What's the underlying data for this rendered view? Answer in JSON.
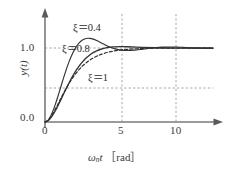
{
  "figure": {
    "name": "step-response-second-order-system",
    "background_color": "#ffffff",
    "axis_color": "#6e6e6e",
    "curve_color": "#333333",
    "grid_color": "#9a9a9a"
  },
  "axes": {
    "y_axis_label": "y(t)",
    "x_axis_label_symbol": "ω",
    "x_axis_label_subscript": "n",
    "x_axis_label_var": "t",
    "x_axis_label_unit": "［rad］",
    "x_axis_label_full": "ωnt ［rad］",
    "x_ticks": [
      "0",
      "5",
      "10"
    ],
    "y_ticks": [
      "0.0",
      "1.0"
    ]
  },
  "curve_labels": [
    {
      "name": "zeta-0-4",
      "text": "ξ＝0.4"
    },
    {
      "name": "zeta-0-8",
      "text": "ξ＝0.8"
    },
    {
      "name": "zeta-1",
      "text": "ξ＝1"
    }
  ],
  "chart_data": {
    "type": "line",
    "title": "",
    "xlabel": "ωnt ［rad］",
    "ylabel": "y(t)",
    "xlim": [
      0,
      12.2
    ],
    "ylim": [
      0,
      1.42
    ],
    "x_ticks": [
      0,
      5,
      10
    ],
    "x_tick_labels": [
      "0",
      "5",
      "10"
    ],
    "y_ticks": [
      0.0,
      1.0
    ],
    "y_tick_labels": [
      "0.0",
      "1.0"
    ],
    "grid": true,
    "gridlines_horizontal": [
      0.5,
      1.0
    ],
    "gridlines_vertical": [
      5,
      10
    ],
    "legend": "inline-annotations",
    "series": [
      {
        "name": "ξ＝0.4",
        "zeta": 0.4,
        "style": "solid",
        "color": "#333333",
        "x": [
          0,
          0.25,
          0.5,
          0.75,
          1,
          1.25,
          1.5,
          1.75,
          2,
          2.25,
          2.5,
          2.75,
          3,
          3.25,
          3.5,
          3.75,
          4,
          4.25,
          4.5,
          4.75,
          5,
          5.5,
          6,
          6.5,
          7,
          7.5,
          8,
          8.5,
          9,
          9.5,
          10,
          10.5,
          11,
          11.5,
          12,
          12.2
        ],
        "y": [
          0,
          0.03,
          0.115,
          0.238,
          0.384,
          0.537,
          0.684,
          0.816,
          0.926,
          1.012,
          1.073,
          1.111,
          1.129,
          1.131,
          1.12,
          1.101,
          1.078,
          1.053,
          1.03,
          1.009,
          0.993,
          0.972,
          0.966,
          0.971,
          0.982,
          0.994,
          1.004,
          1.011,
          1.014,
          1.013,
          1.009,
          1.004,
          0.999,
          0.996,
          0.994,
          0.994
        ]
      },
      {
        "name": "ξ＝0.8",
        "zeta": 0.8,
        "style": "solid",
        "color": "#333333",
        "x": [
          0,
          0.25,
          0.5,
          0.75,
          1,
          1.25,
          1.5,
          1.75,
          2,
          2.25,
          2.5,
          2.75,
          3,
          3.25,
          3.5,
          3.75,
          4,
          4.5,
          5,
          5.5,
          6,
          7,
          8,
          9,
          10,
          11,
          12,
          12.2
        ],
        "y": [
          0,
          0.021,
          0.075,
          0.152,
          0.243,
          0.34,
          0.437,
          0.53,
          0.616,
          0.693,
          0.761,
          0.819,
          0.867,
          0.906,
          0.937,
          0.961,
          0.98,
          1.004,
          1.015,
          1.018,
          1.017,
          1.009,
          1.003,
          1.0,
          0.999,
          1.0,
          1.0,
          1.0
        ]
      },
      {
        "name": "ξ＝1",
        "zeta": 1.0,
        "style": "dashed",
        "color": "#333333",
        "x": [
          0,
          0.25,
          0.5,
          0.75,
          1,
          1.25,
          1.5,
          1.75,
          2,
          2.25,
          2.5,
          2.75,
          3,
          3.25,
          3.5,
          3.75,
          4,
          4.5,
          5,
          5.5,
          6,
          7,
          8,
          9,
          10,
          11,
          12,
          12.2
        ],
        "y": [
          0,
          0.0265,
          0.0902,
          0.1734,
          0.2642,
          0.3554,
          0.4422,
          0.5221,
          0.594,
          0.6577,
          0.7135,
          0.7619,
          0.8009,
          0.8355,
          0.8641,
          0.8881,
          0.9084,
          0.9389,
          0.9596,
          0.9735,
          0.9826,
          0.9927,
          0.997,
          0.9988,
          0.9995,
          0.9998,
          0.9999,
          0.9999
        ]
      }
    ]
  }
}
